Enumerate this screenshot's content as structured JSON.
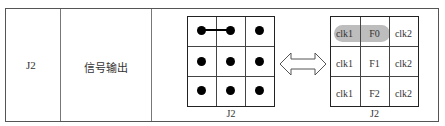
{
  "row": {
    "id": "J2",
    "function": "信号输出"
  },
  "jumper_diagram": {
    "label": "J2",
    "rows": 3,
    "cols": 3,
    "bridged_pins": [
      [
        0,
        0
      ],
      [
        0,
        1
      ]
    ]
  },
  "arrow": {
    "type": "double-headed-arrow"
  },
  "pin_map": {
    "label": "J2",
    "cells": [
      [
        "clk1",
        "F0",
        "clk2"
      ],
      [
        "clk1",
        "F1",
        "clk2"
      ],
      [
        "clk1",
        "F2",
        "clk2"
      ]
    ],
    "highlighted": [
      [
        0,
        0
      ],
      [
        0,
        1
      ]
    ],
    "highlight_color": "#bdbdbd"
  }
}
